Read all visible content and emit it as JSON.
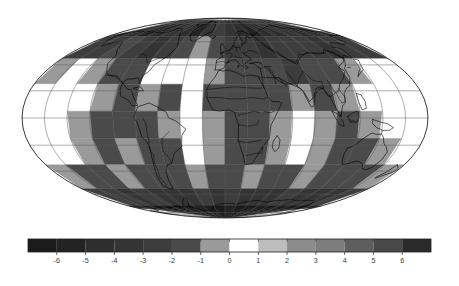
{
  "figure": {
    "title": "",
    "background_color": "#ffffff",
    "width": 459,
    "height": 286
  },
  "map": {
    "name": "world-anomaly-map",
    "projection": "Mollweide",
    "projection_label": "Mollweide (equal-area elliptical)",
    "center_longitude": 0,
    "graticule": {
      "visible": true,
      "latitude_step_deg": 20,
      "longitude_step_deg": 20,
      "line_color": "#5a5a5a",
      "line_width": 0.5,
      "latitudes": [
        -80,
        -60,
        -40,
        -20,
        0,
        20,
        40,
        60,
        80
      ],
      "longitudes": [
        -180,
        -160,
        -140,
        -120,
        -100,
        -80,
        -60,
        -40,
        -20,
        0,
        20,
        40,
        60,
        80,
        100,
        120,
        140,
        160,
        180
      ]
    },
    "coastlines": {
      "visible": true,
      "color": "#000000",
      "line_width": 0.6
    },
    "country_borders": {
      "visible": true,
      "color": "#000000",
      "line_width": 0.45
    },
    "outline": {
      "visible": true,
      "color": "#000000",
      "line_width": 0.7
    },
    "ellipse": {
      "center_x": 225,
      "center_y": 118,
      "semi_axis_x": 203,
      "semi_axis_y": 100
    },
    "field": {
      "description": "grayscale anomaly field rendered over the globe",
      "range_min": -7,
      "range_max": 7,
      "nodata_color": "#ffffff"
    }
  },
  "colorbar": {
    "name": "anomaly-colorbar",
    "orientation": "horizontal",
    "x_left": 28,
    "x_right": 431,
    "y_top": 239,
    "y_bottom": 252,
    "vmin": -7,
    "vmax": 7,
    "n_bands": 14,
    "tick_values": [
      -6,
      -5,
      -4,
      -3,
      -2,
      -1,
      0,
      1,
      2,
      3,
      4,
      5,
      6
    ],
    "tick_labels": [
      "-6",
      "-5",
      "-4",
      "-3",
      "-2",
      "-1",
      "0",
      "1",
      "2",
      "3",
      "4",
      "5",
      "6"
    ],
    "tick_color": "#444444",
    "tick_length": 3,
    "label_color": "#3a3a3a",
    "label_font_size": 7.2,
    "border_color": "#222222",
    "bands": [
      {
        "from": -7,
        "to": -6,
        "color": "#1b1b1b"
      },
      {
        "from": -6,
        "to": -5,
        "color": "#232323"
      },
      {
        "from": -5,
        "to": -4,
        "color": "#2e2e2e"
      },
      {
        "from": -4,
        "to": -3,
        "color": "#343434"
      },
      {
        "from": -3,
        "to": -2,
        "color": "#3d3d3d"
      },
      {
        "from": -2,
        "to": -1,
        "color": "#4a4a4a"
      },
      {
        "from": -1,
        "to": 0,
        "color": "#9a9a9a"
      },
      {
        "from": 0,
        "to": 1,
        "color": "#ffffff"
      },
      {
        "from": 1,
        "to": 2,
        "color": "#bdbdbd"
      },
      {
        "from": 2,
        "to": 3,
        "color": "#8c8c8c"
      },
      {
        "from": 3,
        "to": 4,
        "color": "#7d7d7d"
      },
      {
        "from": 4,
        "to": 5,
        "color": "#5e5e5e"
      },
      {
        "from": 5,
        "to": 6,
        "color": "#484848"
      },
      {
        "from": 6,
        "to": 7,
        "color": "#2a2a2a"
      }
    ]
  },
  "chart_data": {
    "type": "heatmap",
    "title": "",
    "subtitle": "",
    "xlabel": "",
    "ylabel": "",
    "projection": "Mollweide",
    "colorbar_label": "",
    "colorbar_ticks": [
      -6,
      -5,
      -4,
      -3,
      -2,
      -1,
      0,
      1,
      2,
      3,
      4,
      5,
      6
    ],
    "colorbar_tick_labels": [
      "-6",
      "-5",
      "-4",
      "-3",
      "-2",
      "-1",
      "0",
      "1",
      "2",
      "3",
      "4",
      "5",
      "6"
    ],
    "clim": [
      -7,
      7
    ],
    "colormap": "diverging-grayscale",
    "grid": true,
    "legend_position": "bottom",
    "grid_lon_step": 20,
    "grid_lat_step": 20,
    "cells": [
      {
        "lon": -170,
        "lat": 75,
        "value": -4.5
      },
      {
        "lon": -150,
        "lat": 75,
        "value": -5.0
      },
      {
        "lon": -130,
        "lat": 75,
        "value": -5.5
      },
      {
        "lon": -110,
        "lat": 75,
        "value": -5.0
      },
      {
        "lon": -90,
        "lat": 75,
        "value": -4.0
      },
      {
        "lon": -70,
        "lat": 75,
        "value": -4.5
      },
      {
        "lon": -50,
        "lat": 75,
        "value": -5.5
      },
      {
        "lon": -30,
        "lat": 75,
        "value": -4.0
      },
      {
        "lon": -10,
        "lat": 75,
        "value": -3.0
      },
      {
        "lon": 10,
        "lat": 75,
        "value": -3.5
      },
      {
        "lon": 30,
        "lat": 75,
        "value": -5.0
      },
      {
        "lon": 50,
        "lat": 75,
        "value": -5.5
      },
      {
        "lon": 70,
        "lat": 75,
        "value": -5.0
      },
      {
        "lon": 90,
        "lat": 75,
        "value": -4.5
      },
      {
        "lon": 110,
        "lat": 75,
        "value": -4.0
      },
      {
        "lon": 130,
        "lat": 75,
        "value": -4.5
      },
      {
        "lon": 150,
        "lat": 75,
        "value": -5.0
      },
      {
        "lon": 170,
        "lat": 75,
        "value": -4.5
      },
      {
        "lon": -170,
        "lat": 55,
        "value": -2.5
      },
      {
        "lon": -150,
        "lat": 55,
        "value": -3.0
      },
      {
        "lon": -130,
        "lat": 55,
        "value": -2.0
      },
      {
        "lon": -110,
        "lat": 55,
        "value": -2.5
      },
      {
        "lon": -90,
        "lat": 55,
        "value": -3.5
      },
      {
        "lon": -70,
        "lat": 55,
        "value": -3.0
      },
      {
        "lon": -50,
        "lat": 55,
        "value": -2.0
      },
      {
        "lon": -30,
        "lat": 55,
        "value": -1.0
      },
      {
        "lon": -10,
        "lat": 55,
        "value": -1.5
      },
      {
        "lon": 10,
        "lat": 55,
        "value": -2.5
      },
      {
        "lon": 30,
        "lat": 55,
        "value": -3.0
      },
      {
        "lon": 50,
        "lat": 55,
        "value": -3.5
      },
      {
        "lon": 70,
        "lat": 55,
        "value": -3.0
      },
      {
        "lon": 90,
        "lat": 55,
        "value": -2.5
      },
      {
        "lon": 110,
        "lat": 55,
        "value": -3.0
      },
      {
        "lon": 130,
        "lat": 55,
        "value": -3.5
      },
      {
        "lon": 150,
        "lat": 55,
        "value": -3.0
      },
      {
        "lon": 170,
        "lat": 55,
        "value": -2.5
      },
      {
        "lon": -170,
        "lat": 35,
        "value": -0.5
      },
      {
        "lon": -150,
        "lat": 35,
        "value": 0.5
      },
      {
        "lon": -130,
        "lat": 35,
        "value": -1.0
      },
      {
        "lon": -110,
        "lat": 35,
        "value": -2.0
      },
      {
        "lon": -90,
        "lat": 35,
        "value": -1.5
      },
      {
        "lon": -70,
        "lat": 35,
        "value": 0.5
      },
      {
        "lon": -50,
        "lat": 35,
        "value": 0.5
      },
      {
        "lon": -30,
        "lat": 35,
        "value": 0.5
      },
      {
        "lon": -10,
        "lat": 35,
        "value": -1.0
      },
      {
        "lon": 10,
        "lat": 35,
        "value": -1.5
      },
      {
        "lon": 30,
        "lat": 35,
        "value": -2.0
      },
      {
        "lon": 50,
        "lat": 35,
        "value": -2.0
      },
      {
        "lon": 70,
        "lat": 35,
        "value": -2.5
      },
      {
        "lon": 90,
        "lat": 35,
        "value": -2.0
      },
      {
        "lon": 110,
        "lat": 35,
        "value": -1.5
      },
      {
        "lon": 130,
        "lat": 35,
        "value": -1.0
      },
      {
        "lon": 150,
        "lat": 35,
        "value": 0.5
      },
      {
        "lon": 170,
        "lat": 35,
        "value": 0.5
      },
      {
        "lon": -170,
        "lat": 15,
        "value": 0.5
      },
      {
        "lon": -150,
        "lat": 15,
        "value": 0.5
      },
      {
        "lon": -130,
        "lat": 15,
        "value": 0.5
      },
      {
        "lon": -110,
        "lat": 15,
        "value": -1.0
      },
      {
        "lon": -90,
        "lat": 15,
        "value": -1.5
      },
      {
        "lon": -70,
        "lat": 15,
        "value": -1.0
      },
      {
        "lon": -50,
        "lat": 15,
        "value": -1.5
      },
      {
        "lon": -30,
        "lat": 15,
        "value": 0.5
      },
      {
        "lon": -10,
        "lat": 15,
        "value": -1.5
      },
      {
        "lon": 10,
        "lat": 15,
        "value": -2.0
      },
      {
        "lon": 30,
        "lat": 15,
        "value": -2.0
      },
      {
        "lon": 50,
        "lat": 15,
        "value": -1.5
      },
      {
        "lon": 70,
        "lat": 15,
        "value": -1.0
      },
      {
        "lon": 90,
        "lat": 15,
        "value": -1.5
      },
      {
        "lon": 110,
        "lat": 15,
        "value": -1.0
      },
      {
        "lon": 130,
        "lat": 15,
        "value": 0.5
      },
      {
        "lon": 150,
        "lat": 15,
        "value": 0.5
      },
      {
        "lon": 170,
        "lat": 15,
        "value": 0.5
      },
      {
        "lon": -170,
        "lat": -5,
        "value": 0.5
      },
      {
        "lon": -150,
        "lat": -5,
        "value": 0.5
      },
      {
        "lon": -130,
        "lat": -5,
        "value": -1.0
      },
      {
        "lon": -110,
        "lat": -5,
        "value": -1.5
      },
      {
        "lon": -90,
        "lat": -5,
        "value": -1.5
      },
      {
        "lon": -70,
        "lat": -5,
        "value": -1.5
      },
      {
        "lon": -50,
        "lat": -5,
        "value": -1.0
      },
      {
        "lon": -30,
        "lat": -5,
        "value": 0.5
      },
      {
        "lon": -10,
        "lat": -5,
        "value": -1.0
      },
      {
        "lon": 10,
        "lat": -5,
        "value": -1.5
      },
      {
        "lon": 30,
        "lat": -5,
        "value": -1.5
      },
      {
        "lon": 50,
        "lat": -5,
        "value": -1.0
      },
      {
        "lon": 70,
        "lat": -5,
        "value": 0.5
      },
      {
        "lon": 90,
        "lat": -5,
        "value": -1.0
      },
      {
        "lon": 110,
        "lat": -5,
        "value": -1.5
      },
      {
        "lon": 130,
        "lat": -5,
        "value": -1.0
      },
      {
        "lon": 150,
        "lat": -5,
        "value": 0.5
      },
      {
        "lon": 170,
        "lat": -5,
        "value": 0.5
      },
      {
        "lon": -170,
        "lat": -25,
        "value": 0.5
      },
      {
        "lon": -150,
        "lat": -25,
        "value": 0.5
      },
      {
        "lon": -130,
        "lat": -25,
        "value": -1.0
      },
      {
        "lon": -110,
        "lat": -25,
        "value": -1.5
      },
      {
        "lon": -90,
        "lat": -25,
        "value": -1.0
      },
      {
        "lon": -70,
        "lat": -25,
        "value": -1.5
      },
      {
        "lon": -50,
        "lat": -25,
        "value": -1.5
      },
      {
        "lon": -30,
        "lat": -25,
        "value": 0.5
      },
      {
        "lon": -10,
        "lat": -25,
        "value": -1.0
      },
      {
        "lon": 10,
        "lat": -25,
        "value": -1.5
      },
      {
        "lon": 30,
        "lat": -25,
        "value": -1.5
      },
      {
        "lon": 50,
        "lat": -25,
        "value": -1.0
      },
      {
        "lon": 70,
        "lat": -25,
        "value": 0.5
      },
      {
        "lon": 90,
        "lat": -25,
        "value": -1.0
      },
      {
        "lon": 110,
        "lat": -25,
        "value": -1.5
      },
      {
        "lon": 130,
        "lat": -25,
        "value": -1.5
      },
      {
        "lon": 150,
        "lat": -25,
        "value": -1.0
      },
      {
        "lon": 170,
        "lat": -25,
        "value": 0.5
      },
      {
        "lon": -170,
        "lat": -45,
        "value": -1.0
      },
      {
        "lon": -150,
        "lat": -45,
        "value": -1.5
      },
      {
        "lon": -130,
        "lat": -45,
        "value": -1.5
      },
      {
        "lon": -110,
        "lat": -45,
        "value": -1.0
      },
      {
        "lon": -90,
        "lat": -45,
        "value": -1.5
      },
      {
        "lon": -70,
        "lat": -45,
        "value": -2.0
      },
      {
        "lon": -50,
        "lat": -45,
        "value": -1.5
      },
      {
        "lon": -30,
        "lat": -45,
        "value": -1.0
      },
      {
        "lon": -10,
        "lat": -45,
        "value": -1.5
      },
      {
        "lon": 10,
        "lat": -45,
        "value": -1.5
      },
      {
        "lon": 30,
        "lat": -45,
        "value": -1.0
      },
      {
        "lon": 50,
        "lat": -45,
        "value": -1.5
      },
      {
        "lon": 70,
        "lat": -45,
        "value": -1.5
      },
      {
        "lon": 90,
        "lat": -45,
        "value": -1.0
      },
      {
        "lon": 110,
        "lat": -45,
        "value": -1.5
      },
      {
        "lon": 130,
        "lat": -45,
        "value": -2.0
      },
      {
        "lon": 150,
        "lat": -45,
        "value": -1.5
      },
      {
        "lon": 170,
        "lat": -45,
        "value": -1.0
      },
      {
        "lon": -170,
        "lat": -65,
        "value": -2.5
      },
      {
        "lon": -150,
        "lat": -65,
        "value": -3.0
      },
      {
        "lon": -130,
        "lat": -65,
        "value": -3.5
      },
      {
        "lon": -110,
        "lat": -65,
        "value": -3.0
      },
      {
        "lon": -90,
        "lat": -65,
        "value": -3.5
      },
      {
        "lon": -70,
        "lat": -65,
        "value": -4.0
      },
      {
        "lon": -50,
        "lat": -65,
        "value": -3.5
      },
      {
        "lon": -30,
        "lat": -65,
        "value": -3.0
      },
      {
        "lon": -10,
        "lat": -65,
        "value": -3.5
      },
      {
        "lon": 10,
        "lat": -65,
        "value": -3.0
      },
      {
        "lon": 30,
        "lat": -65,
        "value": -3.5
      },
      {
        "lon": 50,
        "lat": -65,
        "value": -4.0
      },
      {
        "lon": 70,
        "lat": -65,
        "value": -3.5
      },
      {
        "lon": 90,
        "lat": -65,
        "value": -3.0
      },
      {
        "lon": 110,
        "lat": -65,
        "value": -3.5
      },
      {
        "lon": 130,
        "lat": -65,
        "value": -4.0
      },
      {
        "lon": 150,
        "lat": -65,
        "value": -3.5
      },
      {
        "lon": 170,
        "lat": -65,
        "value": -3.0
      },
      {
        "lon": -170,
        "lat": -82,
        "value": -5.5
      },
      {
        "lon": -150,
        "lat": -82,
        "value": -6.0
      },
      {
        "lon": -130,
        "lat": -82,
        "value": -6.5
      },
      {
        "lon": -110,
        "lat": -82,
        "value": -6.0
      },
      {
        "lon": -90,
        "lat": -82,
        "value": -6.5
      },
      {
        "lon": -70,
        "lat": -82,
        "value": -6.5
      },
      {
        "lon": -50,
        "lat": -82,
        "value": -6.0
      },
      {
        "lon": -30,
        "lat": -82,
        "value": -6.5
      },
      {
        "lon": -10,
        "lat": -82,
        "value": -6.5
      },
      {
        "lon": 10,
        "lat": -82,
        "value": -6.0
      },
      {
        "lon": 30,
        "lat": -82,
        "value": -6.5
      },
      {
        "lon": 50,
        "lat": -82,
        "value": -6.5
      },
      {
        "lon": 70,
        "lat": -82,
        "value": -6.0
      },
      {
        "lon": 90,
        "lat": -82,
        "value": -6.5
      },
      {
        "lon": 110,
        "lat": -82,
        "value": -6.0
      },
      {
        "lon": 130,
        "lat": -82,
        "value": -6.5
      },
      {
        "lon": 150,
        "lat": -82,
        "value": -6.5
      },
      {
        "lon": 170,
        "lat": -82,
        "value": -6.0
      }
    ]
  }
}
